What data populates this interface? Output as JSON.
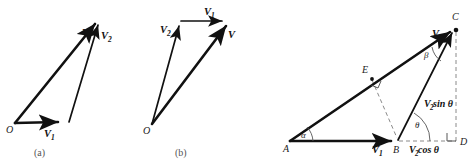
{
  "figure": {
    "background": "#ffffff",
    "ink": "#111111",
    "dash_color": "#8a8a8a"
  },
  "panels": [
    {
      "id": "a",
      "caption": "(a)",
      "origin_label": "O",
      "vectors": [
        {
          "name": "V1",
          "label": "V",
          "sub": "1"
        },
        {
          "name": "V2",
          "label": "V",
          "sub": "2"
        },
        {
          "name": "V",
          "label": "V",
          "sub": ""
        }
      ]
    },
    {
      "id": "b",
      "caption": "(b)",
      "origin_label": "O",
      "vectors": [
        {
          "name": "V1",
          "label": "V",
          "sub": "1"
        },
        {
          "name": "V2",
          "label": "V",
          "sub": "2"
        },
        {
          "name": "V",
          "label": "V",
          "sub": ""
        }
      ]
    },
    {
      "id": "c",
      "caption": "",
      "points": [
        {
          "name": "A",
          "label": "A"
        },
        {
          "name": "B",
          "label": "B"
        },
        {
          "name": "C",
          "label": "C"
        },
        {
          "name": "D",
          "label": "D"
        },
        {
          "name": "E",
          "label": "E"
        }
      ],
      "angles": [
        {
          "name": "alpha",
          "label": "α",
          "at": "A"
        },
        {
          "name": "beta",
          "label": "β",
          "at": "C"
        },
        {
          "name": "theta",
          "label": "θ",
          "at": "B"
        }
      ],
      "vectors": [
        {
          "name": "V1",
          "label": "V",
          "sub": "1"
        },
        {
          "name": "V",
          "label": "V",
          "sub": ""
        }
      ],
      "components": [
        {
          "name": "v2-sin-theta",
          "label": "V",
          "sub": "2",
          "suffix": " sin θ"
        },
        {
          "name": "v2-cos-theta",
          "label": "V",
          "sub": "2",
          "suffix": " cos θ"
        }
      ]
    }
  ]
}
